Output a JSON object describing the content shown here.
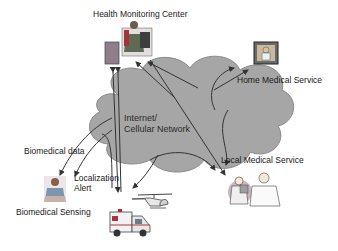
{
  "diagram": {
    "type": "network-architecture",
    "background": "#ffffff",
    "cloud": {
      "label": "Internet/\nCellular Network",
      "fill": "#a6a6a6",
      "stroke": "#8a8a8a"
    },
    "nodes": [
      {
        "id": "health-monitoring-center",
        "label": "Health Monitoring Center",
        "icon": "operator-workstation-icon"
      },
      {
        "id": "home-medical-service",
        "label": "Home Medical Service",
        "icon": "home-doctor-icon"
      },
      {
        "id": "local-medical-service",
        "label": "Local Medical Service",
        "icon": "doctors-icon"
      },
      {
        "id": "biomedical-sensing",
        "label": "Biomedical Sensing",
        "icon": "patient-icon"
      },
      {
        "id": "ambulance",
        "label": "",
        "icon": "ambulance-icon"
      },
      {
        "id": "helicopter",
        "label": "",
        "icon": "helicopter-icon"
      }
    ],
    "edge_labels": {
      "biomedical_data": "Biomedical data",
      "localization_alert": "Localization\nAlert"
    },
    "arrow_color": "#333333"
  }
}
